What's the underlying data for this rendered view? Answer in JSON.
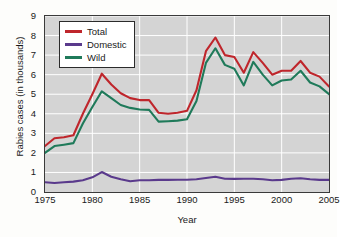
{
  "chart_data": {
    "type": "line",
    "title": "",
    "xlabel": "Year",
    "ylabel": "Rabies cases (in thousands)",
    "xlim": [
      1975,
      2005
    ],
    "ylim": [
      0,
      9
    ],
    "grid": true,
    "legend_position": "upper-left",
    "x_ticks": [
      "1975",
      "1980",
      "1985",
      "1990",
      "1995",
      "2000",
      "2005"
    ],
    "x_tick_values": [
      1975,
      1980,
      1985,
      1990,
      1995,
      2000,
      2005
    ],
    "y_ticks": [
      "0",
      "1",
      "2",
      "3",
      "4",
      "5",
      "6",
      "7",
      "8",
      "9"
    ],
    "y_tick_values": [
      0,
      1,
      2,
      3,
      4,
      5,
      6,
      7,
      8,
      9
    ],
    "x": [
      1975,
      1976,
      1977,
      1978,
      1979,
      1980,
      1981,
      1982,
      1983,
      1984,
      1985,
      1986,
      1987,
      1988,
      1989,
      1990,
      1991,
      1992,
      1993,
      1994,
      1995,
      1996,
      1997,
      1998,
      1999,
      2000,
      2001,
      2002,
      2003,
      2004,
      2005
    ],
    "series": [
      {
        "name": "Total",
        "color": "#bf262c",
        "values": [
          2.35,
          2.75,
          2.8,
          2.9,
          4.0,
          5.0,
          6.05,
          5.5,
          5.05,
          4.8,
          4.7,
          4.7,
          4.05,
          4.0,
          4.05,
          4.15,
          5.2,
          7.2,
          7.9,
          7.0,
          6.9,
          6.1,
          7.15,
          6.6,
          6.0,
          6.2,
          6.2,
          6.7,
          6.1,
          5.9,
          5.4
        ]
      },
      {
        "name": "Domestic",
        "color": "#5a3a8c",
        "values": [
          0.5,
          0.46,
          0.5,
          0.53,
          0.6,
          0.75,
          1.02,
          0.78,
          0.65,
          0.55,
          0.6,
          0.6,
          0.62,
          0.62,
          0.63,
          0.63,
          0.65,
          0.72,
          0.78,
          0.68,
          0.67,
          0.68,
          0.68,
          0.65,
          0.6,
          0.62,
          0.68,
          0.7,
          0.65,
          0.62,
          0.62
        ]
      },
      {
        "name": "Wild",
        "color": "#1f7a5a",
        "values": [
          2.0,
          2.35,
          2.42,
          2.5,
          3.5,
          4.35,
          5.15,
          4.8,
          4.45,
          4.3,
          4.22,
          4.2,
          3.6,
          3.62,
          3.65,
          3.72,
          4.65,
          6.6,
          7.35,
          6.5,
          6.3,
          5.45,
          6.65,
          6.0,
          5.45,
          5.7,
          5.75,
          6.2,
          5.6,
          5.4,
          5.0
        ]
      }
    ]
  },
  "legend": {
    "items": [
      {
        "label": "Total",
        "color": "#bf262c"
      },
      {
        "label": "Domestic",
        "color": "#5a3a8c"
      },
      {
        "label": "Wild",
        "color": "#1f7a5a"
      }
    ]
  },
  "axes": {
    "x_title": "Year",
    "y_title": "Rabies cases (in thousands)"
  }
}
